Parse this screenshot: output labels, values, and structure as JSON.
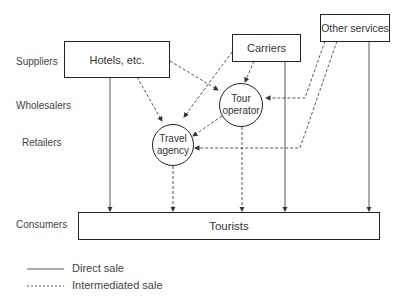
{
  "levels": {
    "suppliers": "Suppliers",
    "wholesalers": "Wholesalers",
    "retailers": "Retailers",
    "consumers": "Consumers"
  },
  "nodes": {
    "hotels": "Hotels, etc.",
    "carriers": "Carriers",
    "other_services": "Other services",
    "tour_operator_line1": "Tour",
    "tour_operator_line2": "operator",
    "travel_agency_line1": "Travel",
    "travel_agency_line2": "agency",
    "tourists": "Tourists"
  },
  "legend": {
    "direct": "Direct sale",
    "intermediated": "Intermediated sale"
  },
  "colors": {
    "line": "#333333",
    "box_border": "#222222"
  }
}
